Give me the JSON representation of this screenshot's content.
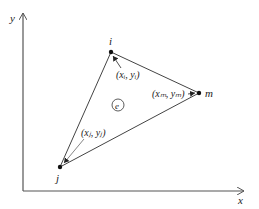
{
  "diagram": {
    "type": "triangular-element",
    "axes": {
      "x_label": "x",
      "y_label": "y"
    },
    "nodes": [
      {
        "id": "i",
        "label": "i",
        "coord_label": "(xᵢ, yᵢ)"
      },
      {
        "id": "j",
        "label": "j",
        "coord_label": "(xⱼ, yⱼ)"
      },
      {
        "id": "m",
        "label": "m",
        "coord_label": "(xₘ, yₘ)"
      }
    ],
    "element_label": "e",
    "colors": {
      "line": "#444444",
      "axis": "#555555",
      "node": "#111111",
      "text": "#222222"
    }
  }
}
